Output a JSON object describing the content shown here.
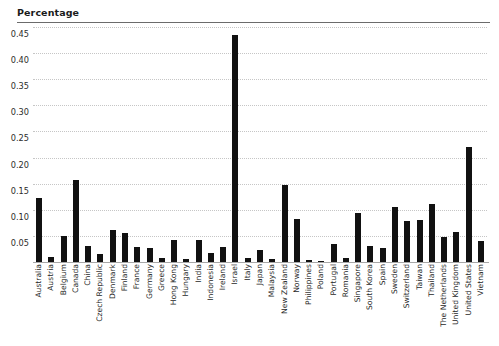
{
  "chart_data": {
    "type": "bar",
    "title": "Percentage",
    "xlabel": "",
    "ylabel": "Percentage",
    "ylim": [
      0,
      0.45
    ],
    "grid": true,
    "legend": false,
    "ytick_labels": [
      "0.45",
      "0.40",
      "0.35",
      "0.30",
      "0.25",
      "0.20",
      "0.15",
      "0.10",
      "0.05"
    ],
    "ytick_values": [
      0.45,
      0.4,
      0.35,
      0.3,
      0.25,
      0.2,
      0.15,
      0.1,
      0.05
    ],
    "bar_color": "#111111",
    "gridline_color": "#c6c6c6",
    "axis_color": "#a8a8a8",
    "categories": [
      "Australia",
      "Austria",
      "Belgium",
      "Canada",
      "China",
      "Czech Republic",
      "Denmark",
      "Finland",
      "France",
      "Germany",
      "Greece",
      "Hong Kong",
      "Hungary",
      "India",
      "Indonesia",
      "Ireland",
      "Israel",
      "Italy",
      "Japan",
      "Malaysia",
      "New Zealand",
      "Norway",
      "Philippines",
      "Poland",
      "Portugal",
      "Romania",
      "Singapore",
      "South Korea",
      "Spain",
      "Sweden",
      "Switzerland",
      "Taiwan",
      "Thailand",
      "The Netherlands",
      "United Kingdom",
      "United States",
      "Vietnam"
    ],
    "values": [
      0.123,
      0.01,
      0.05,
      0.157,
      0.03,
      0.015,
      0.062,
      0.055,
      0.028,
      0.027,
      0.008,
      0.042,
      0.005,
      0.043,
      0.018,
      0.028,
      0.435,
      0.008,
      0.023,
      0.005,
      0.148,
      0.082,
      0.003,
      0.002,
      0.035,
      0.008,
      0.093,
      0.03,
      0.026,
      0.105,
      0.078,
      0.08,
      0.112,
      0.048,
      0.058,
      0.22,
      0.04
    ]
  }
}
